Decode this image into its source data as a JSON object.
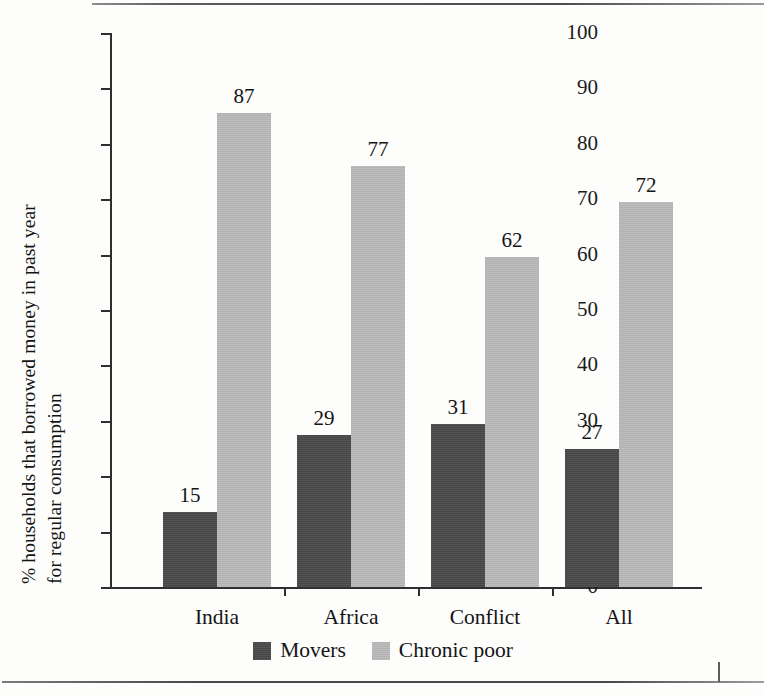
{
  "chart_data": {
    "type": "bar",
    "title": "",
    "subtitle": "",
    "xlabel": "",
    "ylabel": "% households that borrowed money in past year for regular consumption",
    "ylabel_line1": "% households that borrowed money in past year",
    "ylabel_line2": "for regular consumption",
    "ylim": [
      0,
      100
    ],
    "ytick_values": [
      0,
      10,
      20,
      30,
      40,
      50,
      60,
      70,
      80,
      90,
      100
    ],
    "ytick_labels": [
      "0",
      "10",
      "20",
      "30",
      "40",
      "50",
      "60",
      "70",
      "80",
      "90",
      "100"
    ],
    "grid": false,
    "legend_position": "bottom-center",
    "categories": [
      "India",
      "Africa",
      "Conflict",
      "All"
    ],
    "series": [
      {
        "name": "Movers",
        "color": "#4a4a4a",
        "values": [
          15,
          29,
          31,
          27
        ],
        "plotted_heights": [
          13.5,
          27.5,
          29.5,
          25.0
        ],
        "labels": [
          "15",
          "29",
          "31",
          "27"
        ]
      },
      {
        "name": "Chronic poor",
        "color": "#b9b9b9",
        "values": [
          87,
          77,
          62,
          72
        ],
        "plotted_heights": [
          85.5,
          76.0,
          59.5,
          69.5
        ],
        "labels": [
          "87",
          "77",
          "62",
          "72"
        ]
      }
    ]
  },
  "legend": {
    "items": [
      {
        "label": "Movers",
        "color": "#4a4a4a"
      },
      {
        "label": "Chronic poor",
        "color": "#b9b9b9"
      }
    ]
  },
  "axis": {
    "y_label_line1": "% households that borrowed money in past year",
    "y_label_line2": "for regular consumption"
  },
  "ticks": {
    "y": [
      "100",
      "90",
      "80",
      "70",
      "60",
      "50",
      "40",
      "30",
      "20",
      "10",
      "0"
    ]
  },
  "categories": {
    "items": [
      "India",
      "Africa",
      "Conflict",
      "All"
    ]
  }
}
